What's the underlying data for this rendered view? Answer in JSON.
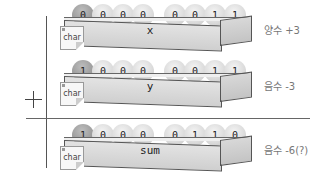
{
  "diagram": {
    "operator": "+",
    "rows": [
      {
        "variable": "x",
        "type": "char",
        "bits": [
          "0",
          "0",
          "0",
          "0",
          "0",
          "0",
          "1",
          "1"
        ],
        "annotation": "양수 +3"
      },
      {
        "variable": "y",
        "type": "char",
        "bits": [
          "1",
          "0",
          "0",
          "0",
          "0",
          "0",
          "1",
          "1"
        ],
        "annotation": "음수 -3"
      },
      {
        "variable": "sum",
        "type": "char",
        "bits": [
          "1",
          "0",
          "0",
          "0",
          "0",
          "1",
          "1",
          "0"
        ],
        "annotation": "음수 -6(?)"
      }
    ]
  }
}
